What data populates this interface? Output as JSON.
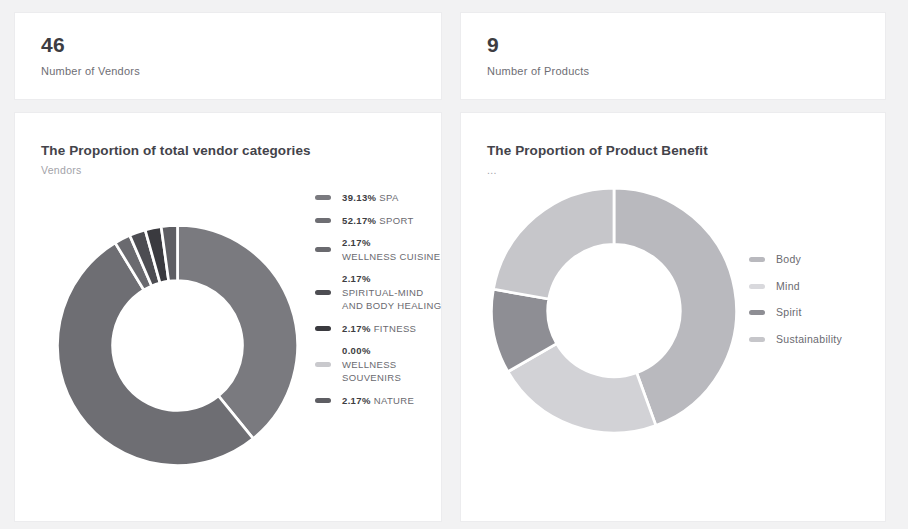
{
  "kpis": [
    {
      "value": "46",
      "label": "Number of Vendors"
    },
    {
      "value": "9",
      "label": "Number of Products"
    }
  ],
  "charts": [
    {
      "title": "The Proportion of total vendor categories",
      "subtitle": "Vendors"
    },
    {
      "title": "The Proportion of Product Benefit",
      "subtitle": "..."
    }
  ],
  "chart_data": [
    {
      "type": "pie",
      "title": "The Proportion of total vendor categories",
      "subtitle": "Vendors",
      "variant": "donut",
      "legend_position": "right",
      "value_suffix": "%",
      "categories": [
        "SPA",
        "SPORT",
        "WELLNESS CUISINE",
        "SPIRITUAL-MIND AND BODY HEALING",
        "FITNESS",
        "WELLNESS SOUVENIRS",
        "NATURE"
      ],
      "values": [
        39.13,
        52.17,
        2.17,
        2.17,
        2.17,
        0.0,
        2.17
      ],
      "labels": [
        "39.13%",
        "52.17%",
        "2.17%",
        "2.17%",
        "2.17%",
        "0.00%",
        "2.17%"
      ],
      "colors": [
        "#7a7a7f",
        "#6e6e73",
        "#6a6a6f",
        "#4d4d52",
        "#3a3a3f",
        "#c9c9cd",
        "#5e5e63"
      ]
    },
    {
      "type": "pie",
      "title": "The Proportion of Product Benefit",
      "subtitle": "...",
      "variant": "donut",
      "legend_position": "right",
      "categories": [
        "Body",
        "Mind",
        "Spirit",
        "Sustainability"
      ],
      "values": [
        44.4,
        22.2,
        11.1,
        22.2
      ],
      "colors": [
        "#b9b9be",
        "#d2d2d6",
        "#8e8e94",
        "#c6c6ca"
      ]
    }
  ],
  "legends": {
    "vendors": [
      {
        "pct": "39.13%",
        "name": "SPA",
        "color": "#7a7a7f",
        "wrap": false
      },
      {
        "pct": "52.17%",
        "name": "SPORT",
        "color": "#6e6e73",
        "wrap": false
      },
      {
        "pct": "2.17%",
        "name": "WELLNESS CUISINE",
        "color": "#6a6a6f",
        "wrap": true
      },
      {
        "pct": "2.17%",
        "name": "SPIRITUAL-MIND AND BODY HEALING",
        "color": "#4d4d52",
        "wrap": true
      },
      {
        "pct": "2.17%",
        "name": "FITNESS",
        "color": "#3a3a3f",
        "wrap": false
      },
      {
        "pct": "0.00%",
        "name": "WELLNESS SOUVENIRS",
        "color": "#c9c9cd",
        "wrap": true
      },
      {
        "pct": "2.17%",
        "name": "NATURE",
        "color": "#5e5e63",
        "wrap": false
      }
    ],
    "benefit": [
      {
        "name": "Body",
        "color": "#b9b9be"
      },
      {
        "name": "Mind",
        "color": "#d9d9dd"
      },
      {
        "name": "Spirit",
        "color": "#8e8e94"
      },
      {
        "name": "Sustainability",
        "color": "#c6c6ca"
      }
    ]
  }
}
